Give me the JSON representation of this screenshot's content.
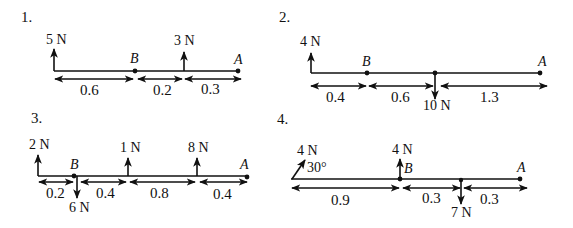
{
  "problems": [
    {
      "number": "1.",
      "forces": [
        {
          "label": "5 N",
          "direction": "up"
        },
        {
          "label": "3 N",
          "direction": "up"
        }
      ],
      "points": {
        "B": "B",
        "A": "A"
      },
      "dimensions": [
        "0.6",
        "0.2",
        "0.3"
      ]
    },
    {
      "number": "2.",
      "forces": [
        {
          "label": "4 N",
          "direction": "up"
        },
        {
          "label": "10 N",
          "direction": "down"
        }
      ],
      "points": {
        "B": "B",
        "A": "A"
      },
      "dimensions": [
        "0.4",
        "0.6",
        "1.3"
      ]
    },
    {
      "number": "3.",
      "forces": [
        {
          "label": "2 N",
          "direction": "up"
        },
        {
          "label": "6 N",
          "direction": "down"
        },
        {
          "label": "1 N",
          "direction": "up"
        },
        {
          "label": "8 N",
          "direction": "up"
        }
      ],
      "points": {
        "B": "B",
        "A": "A"
      },
      "dimensions": [
        "0.2",
        "0.4",
        "0.8",
        "0.4"
      ]
    },
    {
      "number": "4.",
      "forces": [
        {
          "label": "4 N",
          "direction": "angled",
          "angle_label": "30°"
        },
        {
          "label": "4 N",
          "direction": "up"
        },
        {
          "label": "7 N",
          "direction": "down"
        }
      ],
      "points": {
        "B": "B",
        "A": "A"
      },
      "dimensions": [
        "0.9",
        "0.3",
        "0.3"
      ]
    }
  ],
  "colors": {
    "ink": "#111111",
    "background": "#ffffff"
  }
}
